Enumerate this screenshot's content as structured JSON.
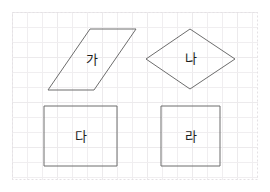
{
  "page": {
    "width": 270,
    "height": 192,
    "background_color": "#ffffff"
  },
  "grid": {
    "visible": true,
    "cell_size": 15,
    "minor_color": "#f0eef0",
    "major_color": "#eceaec",
    "border_color": "#e4e1e4",
    "border_style": "dashed",
    "area": {
      "x": 12,
      "y": 12,
      "width": 246,
      "height": 168
    }
  },
  "style": {
    "shape_stroke_color": "#6d6d6d",
    "shape_stroke_width": 1,
    "shape_fill": "none",
    "label_color": "#1d1d1d",
    "label_font_size": 13
  },
  "shapes": [
    {
      "id": "shape-ga",
      "label": "가",
      "type": "parallelogram",
      "points": "90,29 136,29 94,90 48,90",
      "label_x": 92,
      "label_y": 60
    },
    {
      "id": "shape-na",
      "label": "나",
      "type": "rhombus",
      "points": "190,29 235,59 190,89 146,59",
      "label_x": 191,
      "label_y": 59
    },
    {
      "id": "shape-da",
      "label": "다",
      "type": "rectangle",
      "points": "44,106 117,106 117,166 44,166",
      "label_x": 81,
      "label_y": 137
    },
    {
      "id": "shape-ra",
      "label": "라",
      "type": "square",
      "points": "161,106 220,106 220,166 161,166",
      "label_x": 191,
      "label_y": 137
    }
  ]
}
